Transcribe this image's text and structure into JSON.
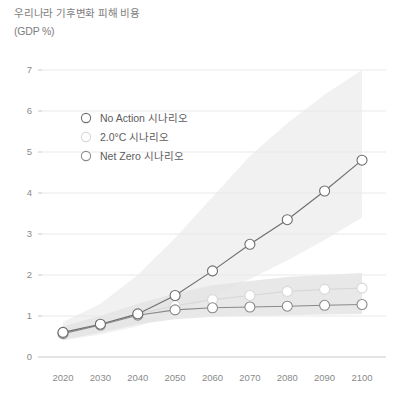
{
  "header": {
    "title": "우리나라 기후변화 피해 비용",
    "subtitle": "(GDP %)"
  },
  "legend": {
    "position": "inside-top-left",
    "items": [
      {
        "label": "No Action 시나리오",
        "marker": "open-circle",
        "color": "#6e6e6e"
      },
      {
        "label": "2.0°C 시나리오",
        "marker": "open-circle",
        "color": "#d8d8d8"
      },
      {
        "label": "Net Zero 시나리오",
        "marker": "open-circle",
        "color": "#8a8a8a"
      }
    ]
  },
  "chart_data": {
    "type": "line",
    "title": "우리나라 기후변화 피해 비용",
    "xlabel": "",
    "ylabel": "(GDP %)",
    "categories": [
      "2020",
      "2030",
      "2040",
      "2050",
      "2060",
      "2070",
      "2080",
      "2090",
      "2100"
    ],
    "x": [
      2020,
      2030,
      2040,
      2050,
      2060,
      2070,
      2080,
      2090,
      2100
    ],
    "ylim": [
      0,
      7
    ],
    "yticks": [
      0,
      1,
      2,
      3,
      4,
      5,
      6,
      7
    ],
    "ytick_labels": [
      "0",
      "1",
      "2",
      "3",
      "4",
      "5",
      "6",
      "7"
    ],
    "grid": true,
    "legend_position": "inside-top-left",
    "series": [
      {
        "name": "No Action 시나리오",
        "color": "#6e6e6e",
        "marker": "open-circle",
        "values": [
          0.6,
          0.8,
          1.05,
          1.5,
          2.1,
          2.75,
          3.35,
          4.05,
          4.8
        ]
      },
      {
        "name": "2.0°C 시나리오",
        "color": "#d8d8d8",
        "marker": "open-circle",
        "values": [
          0.6,
          0.8,
          1.05,
          1.25,
          1.4,
          1.5,
          1.6,
          1.65,
          1.68
        ]
      },
      {
        "name": "Net Zero 시나리오",
        "color": "#8a8a8a",
        "marker": "open-circle",
        "values": [
          0.57,
          0.78,
          1.02,
          1.15,
          1.2,
          1.22,
          1.24,
          1.26,
          1.28
        ]
      }
    ],
    "bands": [
      {
        "name": "No Action 불확실성 범위",
        "color": "#ececec",
        "upper": [
          0.85,
          1.3,
          2.0,
          2.9,
          3.9,
          4.9,
          5.7,
          6.4,
          7.0
        ],
        "lower": [
          0.4,
          0.55,
          0.75,
          1.05,
          1.45,
          1.9,
          2.35,
          2.85,
          3.4
        ]
      },
      {
        "name": "저감 시나리오 불확실성 범위",
        "color": "#e4e4e4",
        "upper": [
          0.75,
          1.0,
          1.3,
          1.55,
          1.75,
          1.85,
          1.95,
          2.0,
          2.05
        ],
        "lower": [
          0.42,
          0.6,
          0.8,
          0.92,
          0.98,
          1.0,
          1.02,
          1.04,
          1.05
        ]
      }
    ]
  }
}
